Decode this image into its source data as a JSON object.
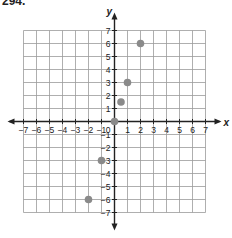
{
  "problem_number": "294.",
  "chart_data": {
    "type": "scatter",
    "title": "",
    "xlabel": "x",
    "ylabel": "y",
    "xlim": [
      -7,
      7
    ],
    "ylim": [
      -7,
      7
    ],
    "grid": true,
    "x_ticks": [
      -7,
      -6,
      -5,
      -4,
      -3,
      -2,
      -1,
      1,
      2,
      3,
      4,
      5,
      6,
      7
    ],
    "y_ticks": [
      7,
      6,
      5,
      4,
      3,
      2,
      1,
      -1,
      -2,
      -3,
      -4,
      -5,
      -6,
      -7
    ],
    "origin_label": "0",
    "points": [
      {
        "x": -2,
        "y": -6
      },
      {
        "x": -1,
        "y": -3
      },
      {
        "x": 0,
        "y": 0
      },
      {
        "x": 0.5,
        "y": 1.5
      },
      {
        "x": 1,
        "y": 3
      },
      {
        "x": 2,
        "y": 6
      }
    ],
    "point_color": "#8a8a8a",
    "grid_color": "#9a9a9a",
    "axis_color": "#222222"
  }
}
